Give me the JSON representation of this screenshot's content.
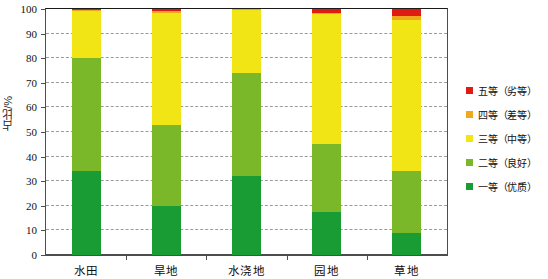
{
  "chart_data": {
    "type": "bar",
    "subtype": "stacked-bar-100",
    "title": "",
    "xlabel": "",
    "ylabel": "占比/%",
    "ylim": [
      0,
      100
    ],
    "ytick_step": 10,
    "yticks": [
      0,
      10,
      20,
      30,
      40,
      50,
      60,
      70,
      80,
      90,
      100
    ],
    "ytick_labels": [
      "0",
      "10",
      "20",
      "30",
      "40",
      "50",
      "60",
      "70",
      "80",
      "90",
      "100"
    ],
    "grid": true,
    "grid_style": "dashed",
    "legend_position": "right",
    "categories": [
      "水田",
      "旱地",
      "水浇地",
      "园地",
      "草地"
    ],
    "series": [
      {
        "name": "一等（优质）",
        "color": "#1a9c34",
        "values": [
          34.0,
          20.0,
          32.0,
          17.5,
          9.0
        ]
      },
      {
        "name": "二等（良好）",
        "color": "#7ab82a",
        "values": [
          46.0,
          33.0,
          42.0,
          27.5,
          25.0
        ]
      },
      {
        "name": "三等（中等）",
        "color": "#f2e516",
        "values": [
          19.2,
          45.5,
          25.5,
          53.0,
          61.5
        ]
      },
      {
        "name": "四等（差等）",
        "color": "#f0a81e",
        "values": [
          0.6,
          0.5,
          0.5,
          0.5,
          1.5
        ]
      },
      {
        "name": "五等（劣等）",
        "color": "#e01b12",
        "values": [
          0.2,
          1.0,
          0.0,
          1.5,
          3.0
        ]
      }
    ]
  },
  "axis": {
    "y_title": "占比/%"
  },
  "legend": {
    "items": [
      {
        "label": "五等（劣等）",
        "color": "#e01b12"
      },
      {
        "label": "四等（差等）",
        "color": "#f0a81e"
      },
      {
        "label": "三等（中等）",
        "color": "#f2e516"
      },
      {
        "label": "二等（良好）",
        "color": "#7ab82a"
      },
      {
        "label": "一等（优质）",
        "color": "#1a9c34"
      }
    ]
  }
}
